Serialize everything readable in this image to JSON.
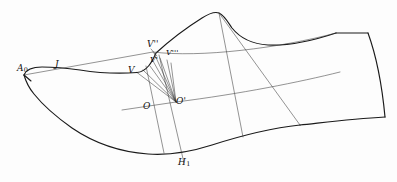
{
  "figure": {
    "background_color": "#fdfdfd",
    "outline_color": "#1a1a1a",
    "construction_color": "#3a3a3a",
    "width": 397,
    "height": 182
  },
  "labels": {
    "a0": {
      "base": "A",
      "sub": "0",
      "text": "A0",
      "x": 17,
      "y": 64
    },
    "j": {
      "base": "J",
      "sub": "",
      "text": "J",
      "x": 55,
      "y": 60
    },
    "v": {
      "base": "V",
      "sub": "",
      "text": "V",
      "x": 128,
      "y": 66
    },
    "v_prime": {
      "base": "V",
      "sub": "",
      "text": "V'",
      "x": 150,
      "y": 56
    },
    "v_double_prime": {
      "base": "V",
      "sub": "",
      "text": "V''",
      "x": 148,
      "y": 42
    },
    "v_triple_prime": {
      "base": "V",
      "sub": "",
      "text": "V'''",
      "x": 166,
      "y": 50
    },
    "o": {
      "base": "O",
      "sub": "",
      "text": "O",
      "x": 143,
      "y": 102
    },
    "o_prime": {
      "base": "O",
      "sub": "",
      "text": "O'",
      "x": 176,
      "y": 99
    },
    "h1": {
      "base": "H",
      "sub": "1",
      "text": "H1",
      "x": 178,
      "y": 158
    }
  },
  "geometry": {
    "description": "Side-view outline of a shoe last with instep construction lines radiating from point O-prime to the V family of points, plus two near-vertical section lines and the heel quadrilateral.",
    "points": {
      "A0": [
        24,
        75
      ],
      "J": [
        58,
        70
      ],
      "V": [
        137,
        72
      ],
      "V_prime": [
        152,
        64
      ],
      "V_double_prime": [
        153,
        52
      ],
      "V_triple_prime": [
        166,
        59
      ],
      "O": [
        152,
        105
      ],
      "O_prime": [
        176,
        102
      ],
      "H1": [
        175,
        152
      ],
      "instep_peak": [
        219,
        13
      ],
      "heel_top_left": [
        336,
        33
      ],
      "heel_top_right": [
        368,
        33
      ],
      "heel_bottom_right": [
        385,
        117
      ],
      "heel_bottom_left": [
        300,
        125
      ]
    }
  }
}
